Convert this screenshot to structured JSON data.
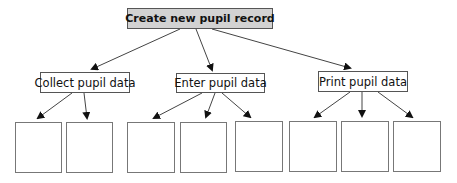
{
  "diagram": {
    "type": "structure-chart",
    "root": {
      "label": "Create new pupil record",
      "fill": "#d2d2d2"
    },
    "children": [
      {
        "label": "Collect pupil data",
        "empty_subboxes": 2
      },
      {
        "label": "Enter pupil data",
        "empty_subboxes": 3
      },
      {
        "label": "Print pupil data",
        "empty_subboxes": 3
      }
    ]
  }
}
